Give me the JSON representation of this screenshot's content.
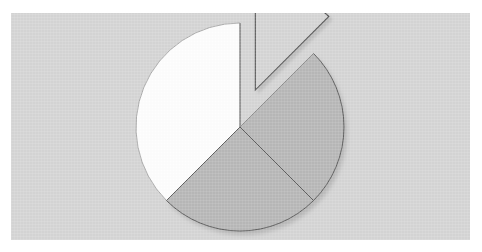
{
  "page": {
    "background_color": "#ffffff",
    "canvas_color": "#d5d5d5",
    "canvas_left": 11,
    "canvas_top": 13,
    "canvas_width": 459,
    "canvas_height": 227
  },
  "chart_data": {
    "type": "pie",
    "title": "",
    "subtitle": "",
    "xlabel": "",
    "ylabel": "",
    "legend": "none",
    "grid": false,
    "start_angle_deg": 0,
    "direction": "clockwise",
    "center_x": 240,
    "center_y": 127,
    "radius": 104,
    "categories": [
      "Slice 1",
      "Slice 2",
      "Slice 3",
      "Slice 4"
    ],
    "values": [
      12.5,
      25.0,
      25.0,
      37.5
    ],
    "percent_labels": [
      "12.5%",
      "25%",
      "25%",
      "37.5%"
    ],
    "angles_deg": [
      45,
      90,
      90,
      135
    ],
    "slices": [
      {
        "name": "Slice 1",
        "value": 12.5,
        "percent": "12.5%",
        "start_deg": 0,
        "end_deg": 45,
        "fill": "#d5d5d5",
        "stroke": "#555555",
        "exploded": true,
        "explode_offset": 40,
        "explode_direction_deg": 22.5
      },
      {
        "name": "Slice 2",
        "value": 25.0,
        "percent": "25%",
        "start_deg": 45,
        "end_deg": 135,
        "fill": "#b8b8b8",
        "stroke": "#555555",
        "exploded": false,
        "explode_offset": 0,
        "explode_direction_deg": 90
      },
      {
        "name": "Slice 3",
        "value": 25.0,
        "percent": "25%",
        "start_deg": 135,
        "end_deg": 225,
        "fill": "#b8b8b8",
        "stroke": "#555555",
        "exploded": false,
        "explode_offset": 0,
        "explode_direction_deg": 180
      },
      {
        "name": "Slice 4",
        "value": 37.5,
        "percent": "37.5%",
        "start_deg": 225,
        "end_deg": 360,
        "fill": "#fdfdfd",
        "stroke": "#9a9a9a",
        "exploded": false,
        "explode_offset": 0,
        "explode_direction_deg": 292.5
      }
    ],
    "shadow": {
      "enabled": true,
      "color": "#bdbdbd",
      "offset_x": 3,
      "offset_y": 4
    }
  }
}
